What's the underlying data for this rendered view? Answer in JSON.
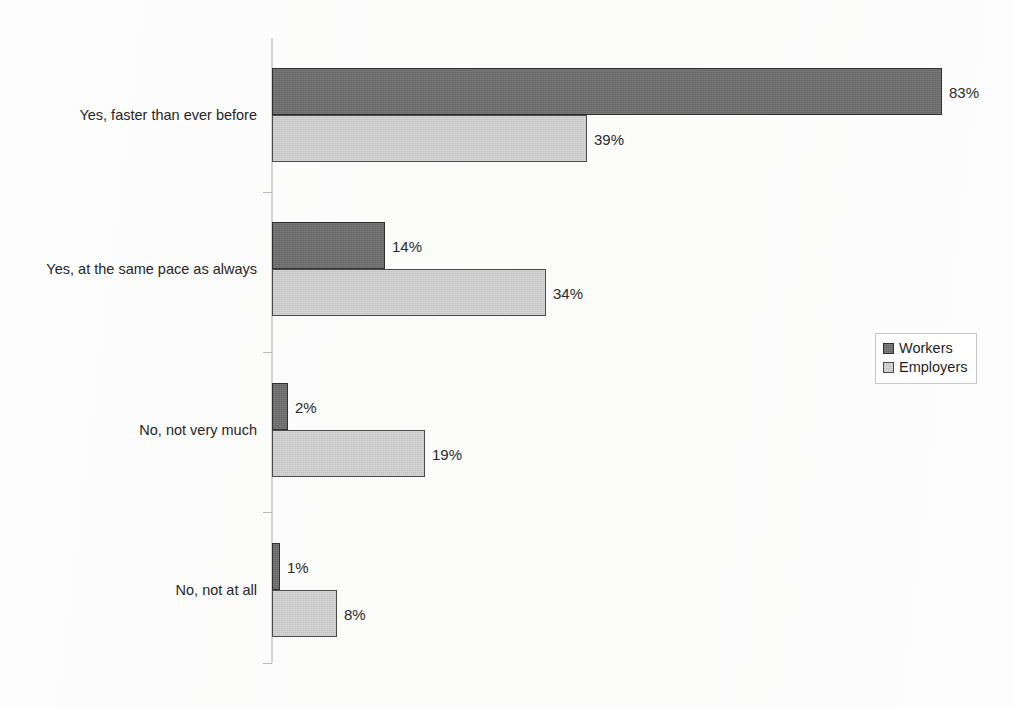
{
  "chart_data": {
    "type": "bar",
    "orientation": "horizontal",
    "title": "",
    "xlabel": "",
    "ylabel": "",
    "xlim": [
      0,
      83
    ],
    "grid": false,
    "legend_position": "right",
    "categories": [
      "Yes, faster than ever before",
      "Yes, at the same pace as always",
      "No, not very much",
      "No, not at all"
    ],
    "series": [
      {
        "name": "Workers",
        "color": "#6e6e6e",
        "values": [
          83,
          14,
          2,
          1
        ],
        "value_labels": [
          "83%",
          "14%",
          "2%",
          "1%"
        ]
      },
      {
        "name": "Employers",
        "color": "#cdcdcd",
        "values": [
          39,
          34,
          19,
          8
        ],
        "value_labels": [
          "39%",
          "34%",
          "19%",
          "8%"
        ]
      }
    ]
  },
  "legend": {
    "items": [
      {
        "label": "Workers"
      },
      {
        "label": "Employers"
      }
    ]
  },
  "footer": {
    "artifact_text": ""
  }
}
